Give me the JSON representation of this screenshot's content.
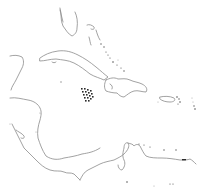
{
  "map": {
    "type": "outline-map",
    "region": "Caribbean Sea and surrounding coastlines",
    "labels": [],
    "colors": {
      "background": "#ffffff",
      "coastline": "#8a8a8a",
      "small_islands": "#555555",
      "highlight_pattern": "#2b2b2b"
    },
    "features": [
      {
        "name": "Florida peninsula",
        "kind": "coastline"
      },
      {
        "name": "Bahamas",
        "kind": "island-group"
      },
      {
        "name": "Cuba",
        "kind": "island"
      },
      {
        "name": "Yucatán Peninsula",
        "kind": "coastline"
      },
      {
        "name": "Highlighted area (checkered pattern)",
        "kind": "marker"
      },
      {
        "name": "Hispaniola",
        "kind": "island"
      },
      {
        "name": "Puerto Rico",
        "kind": "island"
      },
      {
        "name": "Lesser Antilles",
        "kind": "island-group"
      },
      {
        "name": "Central America",
        "kind": "coastline"
      },
      {
        "name": "Northern South America",
        "kind": "coastline"
      }
    ]
  }
}
